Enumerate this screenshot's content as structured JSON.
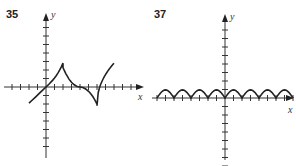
{
  "chart_data": [
    {
      "type": "line",
      "title": "35",
      "xlabel": "x",
      "ylabel": "y",
      "xlim": [
        -5,
        11
      ],
      "ylim": [
        -8,
        8
      ],
      "grid": false,
      "description": "Curve with cusps: rises through origin, upward cusp at x=2, decreasing through x=4, downward cusp at x=6, then rises",
      "x": [
        -2,
        -1,
        0,
        1,
        1.6,
        2,
        2.4,
        3,
        4,
        5,
        5.6,
        6,
        6.2,
        7,
        8
      ],
      "y": [
        -2,
        -1.1,
        0,
        1,
        1.7,
        2.8,
        1.7,
        0.8,
        0,
        -0.8,
        -1.4,
        -2.2,
        -0.5,
        1.8,
        2.8
      ],
      "color": "#222222"
    },
    {
      "type": "line",
      "title": "37",
      "xlabel": "x",
      "ylabel": "y",
      "xlim": [
        -9,
        9
      ],
      "ylim": [
        -8,
        8
      ],
      "grid": false,
      "description": "Periodic arches (|sin|-like) with zeros at even integers, max height 1",
      "zeros": [
        -8,
        -6,
        -4,
        -2,
        0,
        2,
        4,
        6,
        8
      ],
      "peak_height": 1,
      "color": "#222222"
    }
  ],
  "panels": [
    {
      "number": "35",
      "x_axis_label": "x",
      "y_axis_label": "y"
    },
    {
      "number": "37",
      "x_axis_label": "x",
      "y_axis_label": "y"
    }
  ]
}
